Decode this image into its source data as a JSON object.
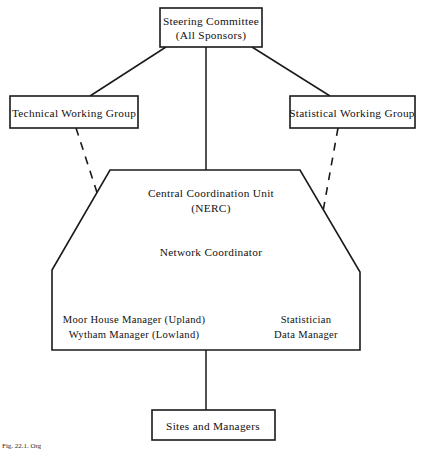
{
  "diagram": {
    "type": "organisational-hierarchy-chart",
    "nodes": {
      "steering_committee": {
        "line1": "Steering Committee",
        "line2": "(All Sponsors)"
      },
      "technical_working_group": {
        "label": "Technical Working Group"
      },
      "statistical_working_group": {
        "label": "Statistical Working Group"
      },
      "central_unit": {
        "line1": "Central Coordination Unit",
        "line2": "(NERC)",
        "line3": "Network Coordinator",
        "left_role_line1": "Moor House Manager (Upland)",
        "left_role_line2": "Wytham Manager (Lowland)",
        "right_role_line1": "Statistician",
        "right_role_line2": "Data Manager"
      },
      "sites_and_managers": {
        "label": "Sites and Managers"
      }
    },
    "caption": "Fig. 22.1. Org",
    "colors": {
      "line": "#1a1a1a",
      "text": "#111111",
      "background": "#ffffff"
    }
  }
}
